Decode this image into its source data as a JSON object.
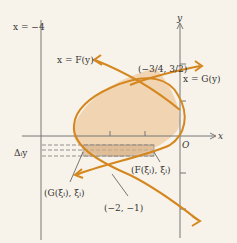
{
  "diagram": {
    "labels": {
      "vertical_line": "x = −4",
      "curve_F": "x = F(y)",
      "curve_G": "x = G(y)",
      "intersection_top": "(−3/4, 3/2)",
      "intersection_top_num_x": "3",
      "intersection_top_den_x": "4",
      "intersection_top_num_y": "3",
      "intersection_top_den_y": "2",
      "intersection_bottom": "(−2, −1)",
      "point_F": "(F(ξᵢ), ξᵢ)",
      "point_G": "(G(ξᵢ), ξᵢ)",
      "delta_y": "Δᵢy",
      "origin": "O",
      "x_axis": "x",
      "y_axis": "y"
    },
    "colors": {
      "curve": "#d4871f",
      "region_fill": "#f0d2ad",
      "strip_fill": "#d8b48c",
      "axis": "#777777",
      "background": "#f8f3ea"
    }
  }
}
